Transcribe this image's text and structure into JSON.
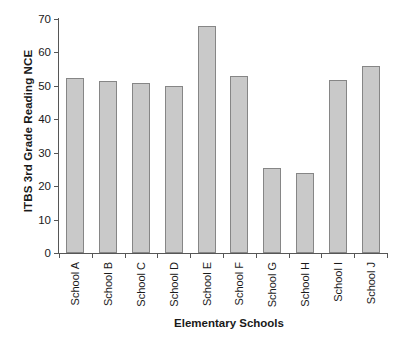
{
  "chart_data": {
    "type": "bar",
    "title": "",
    "xlabel": "Elementary Schools",
    "ylabel": "ITBS 3rd Grade Reading NCE",
    "categories": [
      "School A",
      "School B",
      "School C",
      "School D",
      "School E",
      "School F",
      "School G",
      "School H",
      "School I",
      "School J"
    ],
    "values": [
      52.5,
      51.5,
      51,
      50,
      68,
      53,
      25.5,
      24,
      51.8,
      55.8
    ],
    "ylim": [
      0,
      70
    ],
    "ytick_labels": [
      "70",
      "60",
      "50",
      "40",
      "30",
      "20",
      "10",
      "0"
    ],
    "ytick_values": [
      70,
      60,
      50,
      40,
      30,
      20,
      10,
      0
    ],
    "grid": false,
    "legend": false,
    "legend_position": "none",
    "bar_fill_color": "#c9c9c9",
    "bar_border_color": "#868686",
    "axis_color": "#565656",
    "background_color": "#ffffff"
  }
}
